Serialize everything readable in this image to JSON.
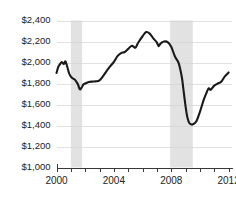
{
  "chart_data": {
    "type": "line",
    "title": "",
    "subtitle": "",
    "xlabel": "",
    "ylabel": "",
    "xlim": [
      2000.0,
      2012.2
    ],
    "ylim": [
      1000,
      2400
    ],
    "grid": true,
    "legend": null,
    "y_tick_labels": [
      "$2,400",
      "$2,200",
      "$2,000",
      "$1,800",
      "$1,600",
      "$1,400",
      "$1,200",
      "$1,000"
    ],
    "y_tick_values": [
      2400,
      2200,
      2000,
      1800,
      1600,
      1400,
      1200,
      1000
    ],
    "x_tick_values": [
      2000,
      2001,
      2002,
      2003,
      2004,
      2005,
      2006,
      2007,
      2008,
      2009,
      2010,
      2011,
      2012
    ],
    "x_tick_labels": [
      "2000",
      "",
      "",
      "",
      "2004",
      "",
      "",
      "",
      "2008",
      "",
      "",
      "",
      "2012"
    ],
    "x_labeled_ticks": [
      {
        "value": 2000,
        "label": "2000"
      },
      {
        "value": 2004,
        "label": "2004"
      },
      {
        "value": 2008,
        "label": "2008"
      },
      {
        "value": 2012,
        "label": "2012"
      }
    ],
    "series": [
      {
        "name": "value",
        "color": "#1a1a1a",
        "x": [
          2000.0,
          2000.12,
          2000.25,
          2000.37,
          2000.5,
          2000.62,
          2000.75,
          2000.87,
          2001.0,
          2001.12,
          2001.25,
          2001.37,
          2001.5,
          2001.62,
          2001.75,
          2001.87,
          2002.0,
          2002.25,
          2002.5,
          2002.75,
          2003.0,
          2003.25,
          2003.5,
          2003.75,
          2004.0,
          2004.25,
          2004.5,
          2004.75,
          2005.0,
          2005.25,
          2005.5,
          2005.62,
          2005.75,
          2006.0,
          2006.25,
          2006.5,
          2006.75,
          2007.0,
          2007.12,
          2007.25,
          2007.5,
          2007.75,
          2008.0,
          2008.25,
          2008.5,
          2008.62,
          2008.75,
          2008.87,
          2009.0,
          2009.12,
          2009.25,
          2009.37,
          2009.5,
          2009.75,
          2010.0,
          2010.25,
          2010.5,
          2010.62,
          2010.75,
          2011.0,
          2011.25,
          2011.5,
          2011.75,
          2012.0
        ],
        "y": [
          1900,
          1955,
          1985,
          2005,
          1985,
          2010,
          1960,
          1900,
          1865,
          1850,
          1840,
          1820,
          1790,
          1745,
          1760,
          1790,
          1800,
          1815,
          1818,
          1820,
          1830,
          1870,
          1920,
          1965,
          2005,
          2060,
          2090,
          2100,
          2130,
          2160,
          2140,
          2170,
          2200,
          2250,
          2290,
          2275,
          2230,
          2190,
          2155,
          2180,
          2200,
          2195,
          2150,
          2060,
          2000,
          1940,
          1850,
          1720,
          1580,
          1480,
          1425,
          1412,
          1410,
          1440,
          1530,
          1640,
          1725,
          1755,
          1740,
          1780,
          1800,
          1820,
          1870,
          1905
        ]
      }
    ],
    "shaded_regions": [
      {
        "name": "recession-2001",
        "x_start": 2001.0,
        "x_end": 2001.78,
        "color": "#e2e2e2"
      },
      {
        "name": "recession-2008",
        "x_start": 2007.92,
        "x_end": 2009.5,
        "color": "#e2e2e2"
      }
    ]
  }
}
